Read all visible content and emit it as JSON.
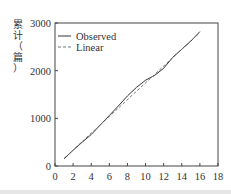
{
  "chart_data": {
    "type": "line",
    "title": "",
    "xlabel": "",
    "ylabel": "累计（篇）",
    "xlim": [
      0,
      18
    ],
    "ylim": [
      0,
      3000
    ],
    "xticks": [
      "0",
      "2",
      "4",
      "6",
      "8",
      "10",
      "12",
      "14",
      "16",
      "18"
    ],
    "yticks": [
      "0",
      "1000",
      "2000",
      "3000"
    ],
    "grid": false,
    "legend_position": "upper left",
    "series": [
      {
        "name": "Observed",
        "style": "solid",
        "x": [
          1,
          2,
          3,
          4,
          5,
          6,
          7,
          8,
          9,
          10,
          11,
          12,
          13,
          14,
          15,
          16
        ],
        "values": [
          150,
          330,
          500,
          660,
          860,
          1060,
          1260,
          1470,
          1650,
          1800,
          1900,
          2050,
          2280,
          2450,
          2620,
          2820
        ]
      },
      {
        "name": "Linear",
        "style": "dashed",
        "x": [
          1,
          16
        ],
        "values": [
          160,
          2800
        ]
      }
    ]
  },
  "axis": {
    "ylabel_chars": [
      "累",
      "计",
      "（",
      "篇",
      "）"
    ]
  },
  "legend": {
    "observed": "Observed",
    "linear": "Linear"
  }
}
